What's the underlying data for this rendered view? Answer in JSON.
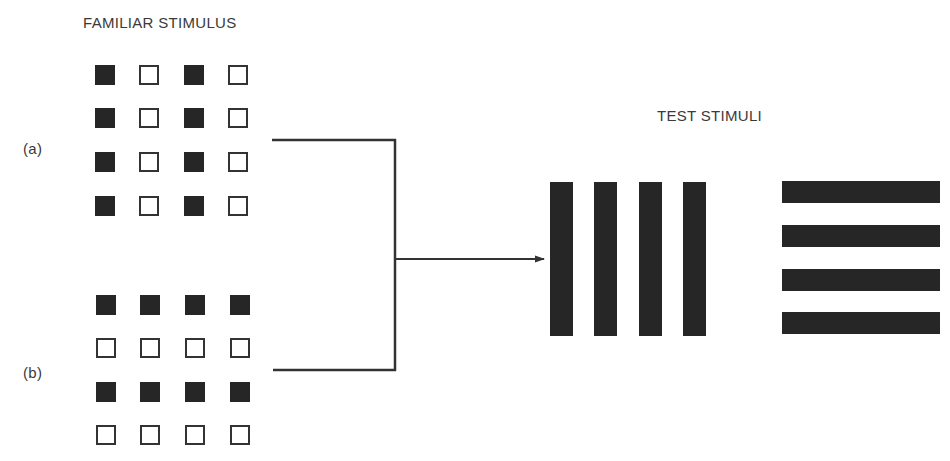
{
  "titles": {
    "familiar": "FAMILIAR STIMULUS",
    "test": "TEST STIMULI"
  },
  "conditions": {
    "a": "(a)",
    "b": "(b)"
  },
  "grid_a": {
    "description": "columns pattern: filled, empty, filled, empty",
    "rows": [
      [
        "filled",
        "empty",
        "filled",
        "empty"
      ],
      [
        "filled",
        "empty",
        "filled",
        "empty"
      ],
      [
        "filled",
        "empty",
        "filled",
        "empty"
      ],
      [
        "filled",
        "empty",
        "filled",
        "empty"
      ]
    ]
  },
  "grid_b": {
    "description": "rows pattern: filled, empty, filled, empty",
    "rows": [
      [
        "filled",
        "filled",
        "filled",
        "filled"
      ],
      [
        "empty",
        "empty",
        "empty",
        "empty"
      ],
      [
        "filled",
        "filled",
        "filled",
        "filled"
      ],
      [
        "empty",
        "empty",
        "empty",
        "empty"
      ]
    ]
  },
  "test_stimuli": {
    "vertical_bars": 4,
    "horizontal_bars": 4
  },
  "colors": {
    "ink": "#262626",
    "background": "#ffffff"
  }
}
